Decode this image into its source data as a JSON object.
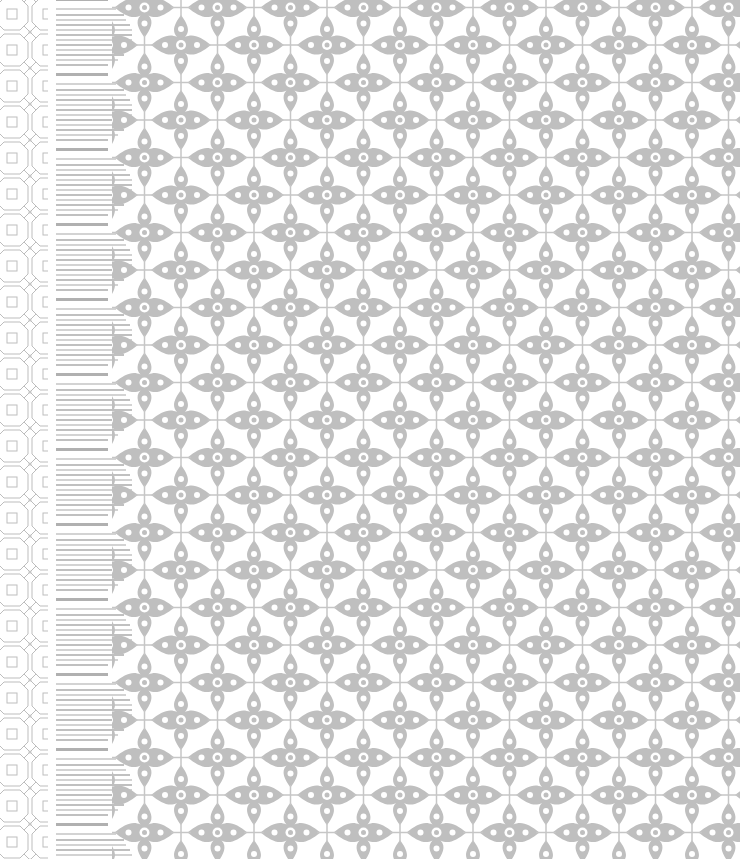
{
  "canvas": {
    "width": 740,
    "height": 859,
    "background": "#ffffff"
  },
  "pattern": {
    "ink_color": "#b8b8b8",
    "lattice": {
      "tile": 36,
      "x": 0,
      "width": 48
    },
    "stripes": {
      "period": 75,
      "x": 54,
      "width": 82
    },
    "damask": {
      "tile_w": 73,
      "tile_h": 75,
      "x": 112
    }
  }
}
